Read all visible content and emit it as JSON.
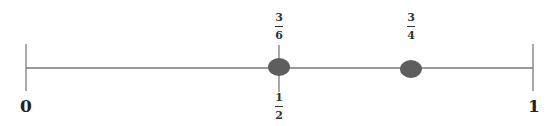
{
  "number_line": {
    "start_label": "0",
    "end_label": "1",
    "line_color": "#7a7a7a",
    "dot_color": "#5e5e5e",
    "points": [
      {
        "value": 0.5,
        "label_above": {
          "num": "3",
          "den": "6"
        },
        "label_below": {
          "num": "1",
          "den": "2"
        },
        "has_tick": true
      },
      {
        "value": 0.75,
        "label_above": {
          "num": "3",
          "den": "4"
        },
        "has_tick": false
      }
    ]
  }
}
